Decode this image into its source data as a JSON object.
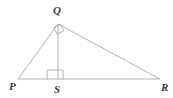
{
  "figure": {
    "background_color": "#ffffff",
    "line_color": "#a9a9a9",
    "label_color": "#3a3a3a",
    "width": 173,
    "height": 98
  },
  "vertices": {
    "P": {
      "label": "P",
      "x": 18,
      "y": 79,
      "label_x": 9,
      "label_y": 90
    },
    "Q": {
      "label": "Q",
      "x": 58,
      "y": 24,
      "label_x": 53,
      "label_y": 14
    },
    "R": {
      "label": "R",
      "x": 160,
      "y": 79,
      "label_x": 161,
      "label_y": 91
    },
    "S": {
      "label": "S",
      "x": 58,
      "y": 79,
      "label_x": 54,
      "label_y": 93
    }
  },
  "segments": [
    {
      "name": "PQ",
      "from": "P",
      "to": "Q",
      "x1": 18,
      "y1": 79,
      "x2": 58,
      "y2": 24
    },
    {
      "name": "QR",
      "from": "Q",
      "to": "R",
      "x1": 58,
      "y1": 24,
      "x2": 160,
      "y2": 79
    },
    {
      "name": "PR",
      "from": "P",
      "to": "R",
      "x1": 18,
      "y1": 79,
      "x2": 160,
      "y2": 79
    },
    {
      "name": "QS",
      "from": "Q",
      "to": "S",
      "x1": 58,
      "y1": 24,
      "x2": 58,
      "y2": 79
    }
  ],
  "right_angle_marks": [
    {
      "name": "right-angle-at-Q",
      "at_vertex": "Q",
      "points": "53.8,27.6 57.2,34.1 63.8,30.7 60.4,24.2"
    },
    {
      "name": "right-angle-at-S",
      "at_vertex": "S",
      "points": "47,79.5 47,70 63,70 63,79.5"
    }
  ]
}
